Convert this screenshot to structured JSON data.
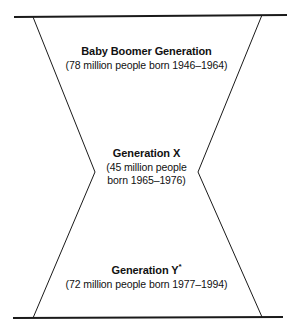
{
  "figure": {
    "type": "hourglass-generation-diagram",
    "shape_name": "hourglass",
    "line_color": "#1a1a1a",
    "background_color": "#ffffff",
    "geometry": {
      "top_rule": {
        "x1": 14,
        "y1": 17,
        "x2": 287,
        "y2": 15
      },
      "bottom_rule": {
        "x1": 13,
        "y1": 318,
        "x2": 283,
        "y2": 317
      },
      "left_upper_diagonal": {
        "x1": 33,
        "y1": 17,
        "x2": 95,
        "y2": 172
      },
      "right_upper_diagonal": {
        "x1": 262,
        "y1": 15,
        "x2": 198,
        "y2": 172
      },
      "left_lower_diagonal": {
        "x1": 95,
        "y1": 172,
        "x2": 33,
        "y2": 318
      },
      "right_lower_diagonal": {
        "x1": 198,
        "y1": 172,
        "x2": 262,
        "y2": 317
      }
    }
  },
  "sections": {
    "baby_boomer": {
      "title": "Baby Boomer Generation",
      "detail_line_1": "(78 million people born 1946–1964)",
      "population": "78 million",
      "birth_year_start": "1946",
      "birth_year_end": "1964"
    },
    "generation_x": {
      "title": "Generation X",
      "detail_line_1": "(45 million people",
      "detail_line_2": "born 1965–1976)",
      "population": "45 million",
      "birth_year_start": "1965",
      "birth_year_end": "1976"
    },
    "generation_y": {
      "title": "Generation Y",
      "title_footnote_marker": "*",
      "detail_line_1": "(72 million people born 1977–1994)",
      "population": "72 million",
      "birth_year_start": "1977",
      "birth_year_end": "1994"
    }
  }
}
